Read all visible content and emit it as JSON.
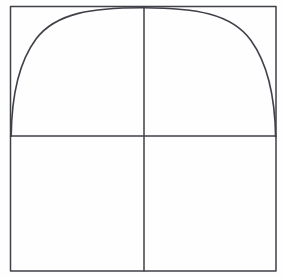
{
  "figure": {
    "background_color": "#fefefe",
    "ink_color": "#3f4048",
    "canvas": {
      "width": 284,
      "height": 278
    }
  },
  "geometry": {
    "frame": {
      "name": "bounding-square",
      "left": 10.5,
      "top": 6.5,
      "right": 276.0,
      "bottom": 271.0,
      "stroke_width": 1.5
    },
    "horizontal_axis": {
      "name": "horizontal-axis",
      "y": 136.0,
      "x_start": 10.5,
      "x_end": 276.0,
      "stroke_width": 1.5
    },
    "vertical_axis": {
      "name": "vertical-axis",
      "x": 144.0,
      "y_start": 6.5,
      "y_end": 271.0,
      "stroke_width": 1.5
    },
    "arc": {
      "name": "semi-elliptical-arc",
      "left_endpoint": {
        "x": 11.0,
        "y": 136.0
      },
      "apex": {
        "x": 144.0,
        "y": 8.0
      },
      "right_endpoint": {
        "x": 276.0,
        "y": 137.0
      },
      "semi_major_axis_x": 132.5,
      "semi_minor_axis_y": 128.0,
      "stroke_width": 1.6,
      "path": "M 11.2 136.2 C 11.6 96.0 19.0 62.0 36.0 39.0 C 56.0 12.5 93.0 7.6 144.0 7.8 C 195.0 8.0 231.5 13.5 251.0 40.5 C 267.5 63.5 275.0 97.5 275.6 136.8"
    }
  },
  "quadrants": [
    {
      "name": "upper-left-quadrant",
      "label": ""
    },
    {
      "name": "upper-right-quadrant",
      "label": ""
    },
    {
      "name": "lower-left-quadrant",
      "label": ""
    },
    {
      "name": "lower-right-quadrant",
      "label": ""
    }
  ],
  "chart_data": {
    "type": "line",
    "title": "",
    "xlabel": "",
    "ylabel": "",
    "grid": false,
    "legend": "none",
    "xlim": [
      -1,
      1
    ],
    "ylim": [
      0,
      1
    ],
    "series": [
      {
        "name": "semi-ellipse",
        "x": [
          -1.0,
          -0.9,
          -0.8,
          -0.7,
          -0.6,
          -0.5,
          -0.4,
          -0.3,
          -0.2,
          -0.1,
          0.0,
          0.1,
          0.2,
          0.3,
          0.4,
          0.5,
          0.6,
          0.7,
          0.8,
          0.9,
          1.0
        ],
        "y": [
          0.0,
          0.436,
          0.6,
          0.714,
          0.8,
          0.866,
          0.917,
          0.954,
          0.98,
          0.995,
          1.0,
          0.995,
          0.98,
          0.954,
          0.917,
          0.866,
          0.8,
          0.714,
          0.6,
          0.436,
          0.0
        ]
      }
    ],
    "annotations": [
      {
        "name": "vertical-axis",
        "type": "vline",
        "x": 0.0
      },
      {
        "name": "horizontal-axis",
        "type": "hline",
        "y": 0.0
      }
    ]
  }
}
